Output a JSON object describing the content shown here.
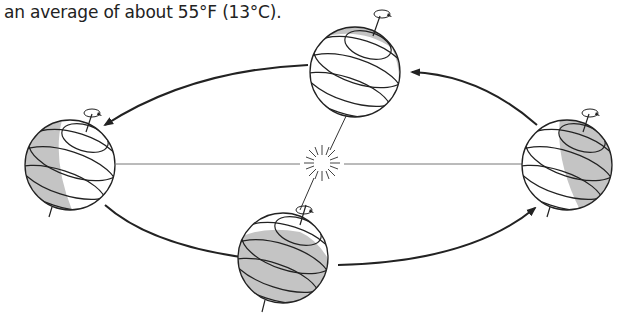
{
  "caption": "an average of about 55°F (13°C).",
  "diagram": {
    "colors": {
      "line": "#222222",
      "shade": "#c4c4c4",
      "background": "#ffffff",
      "orbit_axis": "#888888"
    },
    "sun": {
      "icon": "sun-icon",
      "x": 322,
      "y": 163
    },
    "globes": [
      {
        "id": "top",
        "cx": 355,
        "cy": 72,
        "shade": "thin-right-crescent"
      },
      {
        "id": "left",
        "cx": 70,
        "cy": 165,
        "shade": "left-half"
      },
      {
        "id": "bottom",
        "cx": 283,
        "cy": 258,
        "shade": "lower-cap"
      },
      {
        "id": "right",
        "cx": 567,
        "cy": 165,
        "shade": "right-half"
      }
    ],
    "orbit_direction": "counter-clockwise"
  }
}
